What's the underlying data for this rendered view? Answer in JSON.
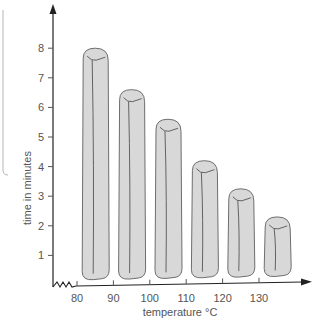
{
  "chart_data": {
    "type": "bar",
    "title": "",
    "xlabel": "temperature °C",
    "ylabel": "time in minutes",
    "categories": [
      "85",
      "95",
      "105",
      "115",
      "125",
      "135"
    ],
    "values": [
      8.0,
      6.6,
      5.6,
      4.2,
      3.25,
      2.3
    ],
    "x_ticks": [
      "80",
      "90",
      "100",
      "110",
      "120",
      "130"
    ],
    "x_tick_values": [
      80,
      90,
      100,
      110,
      120,
      130
    ],
    "y_ticks": [
      "1",
      "2",
      "3",
      "4",
      "5",
      "6",
      "7",
      "8"
    ],
    "y_tick_values": [
      1,
      2,
      3,
      4,
      5,
      6,
      7,
      8
    ],
    "xlim": [
      77,
      141
    ],
    "ylim": [
      0,
      9.5
    ],
    "x_axis_broken": true,
    "grid": false,
    "legend": "none",
    "bar_style": "rounded candle-like columns",
    "colors": {
      "bar_fill": "#d8d8d8",
      "bar_stroke": "#6e6e6e",
      "axis": "#222222",
      "text": "#555555"
    }
  }
}
